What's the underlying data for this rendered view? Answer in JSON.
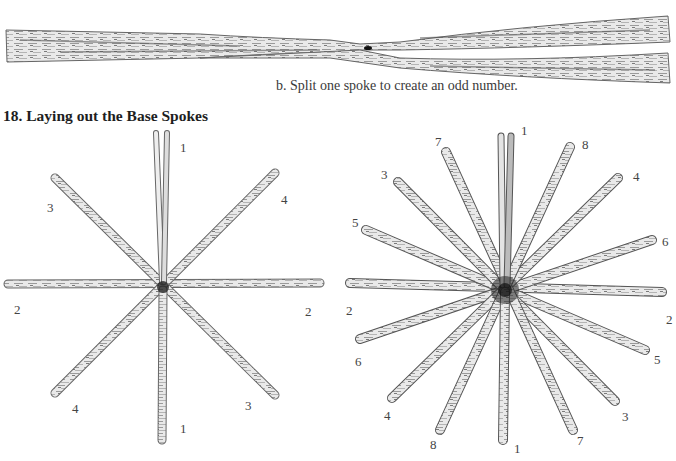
{
  "figure_b": {
    "caption": "b. Split one spoke to create an odd number."
  },
  "section": {
    "number": "18.",
    "title": "18. Laying out the Base Spokes"
  },
  "diagram_left": {
    "labels": [
      {
        "text": "1",
        "x": 180,
        "y": 141
      },
      {
        "text": "3",
        "x": 47,
        "y": 201
      },
      {
        "text": "4",
        "x": 281,
        "y": 193
      },
      {
        "text": "2",
        "x": 14,
        "y": 303
      },
      {
        "text": "2",
        "x": 305,
        "y": 305
      },
      {
        "text": "4",
        "x": 72,
        "y": 402
      },
      {
        "text": "3",
        "x": 245,
        "y": 399
      },
      {
        "text": "1",
        "x": 180,
        "y": 422
      }
    ]
  },
  "diagram_right": {
    "labels": [
      {
        "text": "1",
        "x": 521,
        "y": 124
      },
      {
        "text": "7",
        "x": 435,
        "y": 135
      },
      {
        "text": "8",
        "x": 582,
        "y": 138
      },
      {
        "text": "3",
        "x": 381,
        "y": 168
      },
      {
        "text": "4",
        "x": 633,
        "y": 170
      },
      {
        "text": "5",
        "x": 352,
        "y": 216
      },
      {
        "text": "6",
        "x": 662,
        "y": 235
      },
      {
        "text": "2",
        "x": 346,
        "y": 304
      },
      {
        "text": "2",
        "x": 666,
        "y": 313
      },
      {
        "text": "6",
        "x": 355,
        "y": 355
      },
      {
        "text": "5",
        "x": 654,
        "y": 353
      },
      {
        "text": "4",
        "x": 384,
        "y": 409
      },
      {
        "text": "3",
        "x": 622,
        "y": 410
      },
      {
        "text": "8",
        "x": 430,
        "y": 438
      },
      {
        "text": "7",
        "x": 577,
        "y": 434
      },
      {
        "text": "1",
        "x": 514,
        "y": 442
      }
    ]
  }
}
